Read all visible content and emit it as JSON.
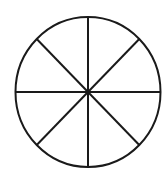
{
  "diagram": {
    "type": "circle-divided-into-sectors",
    "sectors": 8,
    "divider_lines": 4,
    "center": [
      88,
      92
    ],
    "radius_x": 72.5,
    "radius_y": 75,
    "stroke_color": "#1a1a1a",
    "fill_color": "#ffffff",
    "background_color": "#ffffff"
  }
}
